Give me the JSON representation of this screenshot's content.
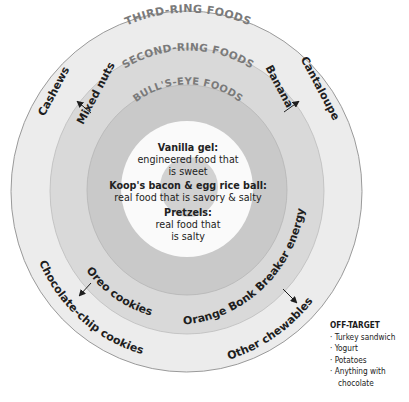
{
  "diagram": {
    "rings": {
      "third": {
        "label": "THIRD-RING FOODS",
        "color": "#ececec"
      },
      "second": {
        "label": "SECOND-RING FOODS",
        "color": "#d9d9d9"
      },
      "bullseye": {
        "label": "BULL'S-EYE FOODS",
        "color": "#c9c9c9"
      },
      "center_color": "#fafafa",
      "core_color": "#d2d2d2",
      "stroke_color": "#9a9a9a"
    },
    "center": {
      "items": [
        {
          "name": "Vanilla gel:",
          "line1": "engineered food that",
          "line2": "is sweet"
        },
        {
          "name": "Koop's bacon & egg rice ball:",
          "line1": "real food that is savory & salty"
        },
        {
          "name": "Pretzels:",
          "line1": "real food that",
          "line2": "is salty"
        }
      ]
    },
    "transitions": [
      {
        "from": "Mixed nuts",
        "to": "Cashews"
      },
      {
        "from": "Banana",
        "to": "Cantaloupe"
      },
      {
        "from": "Oreo cookies",
        "to": "Chocolate-chip cookies"
      },
      {
        "from": "Orange Bonk Breaker energy chew",
        "to": "Other chewables"
      }
    ],
    "off_target": {
      "title": "OFF-TARGET",
      "items": [
        "Turkey sandwich",
        "Yogurt",
        "Potatoes",
        "Anything with",
        "chocolate"
      ]
    }
  }
}
